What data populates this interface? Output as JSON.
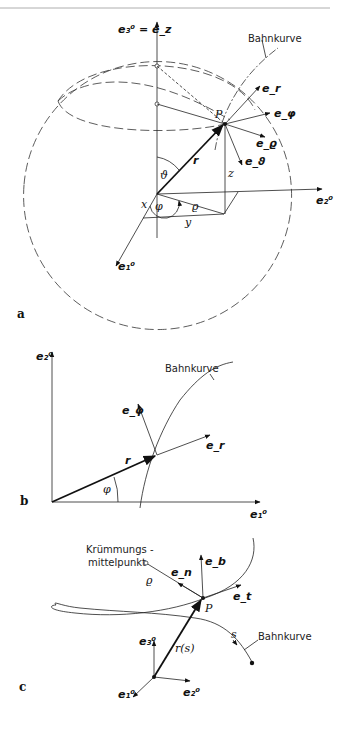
{
  "header": {
    "page_marker": ""
  },
  "panel_a": {
    "label": "a",
    "axis_z": "e₃⁰ = e_z",
    "axis_y": "e₂⁰",
    "axis_x": "e₁⁰",
    "curve_label": "Bahnkurve",
    "point": "P",
    "vectors": [
      "e_r",
      "e_φ",
      "e_ϱ",
      "e_ϑ"
    ],
    "position_vector": "r",
    "angle_theta": "ϑ",
    "angle_phi": "φ",
    "rho": "ϱ",
    "coord_x": "x",
    "coord_y": "y",
    "coord_z": "z"
  },
  "panel_b": {
    "label": "b",
    "axis_y": "e₂⁰",
    "axis_x": "e₁⁰",
    "curve_label": "Bahnkurve",
    "vectors": [
      "e_φ",
      "e_r"
    ],
    "position_vector": "r",
    "angle_phi": "φ"
  },
  "panel_c": {
    "label": "c",
    "center_label_line1": "Krümmungs -",
    "center_label_line2": "mittelpunkt",
    "rho": "ϱ",
    "point": "P",
    "vectors": [
      "e_n",
      "e_b",
      "e_t"
    ],
    "position_vector": "r(s)",
    "arc_length": "s",
    "curve_label": "Bahnkurve",
    "axis_z": "e₃⁰",
    "axis_x": "e₁⁰",
    "axis_y": "e₂⁰"
  }
}
